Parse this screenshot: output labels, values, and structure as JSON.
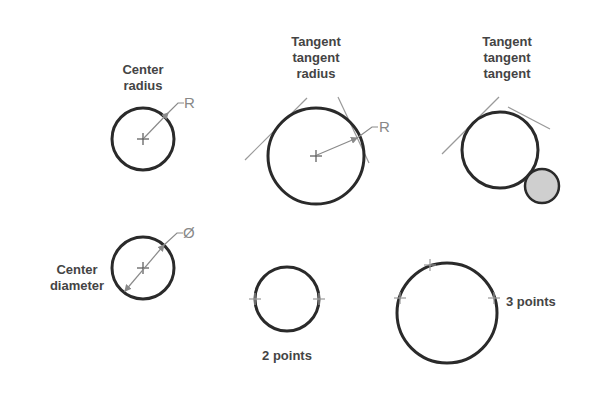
{
  "diagram": {
    "title": "",
    "colors": {
      "circle_stroke": "#2a2a2a",
      "construction_line": "#9a9a9a",
      "label_text": "#444444",
      "dimension_text": "#888888",
      "tangent_fill": "#cfcfcf",
      "background": "#ffffff"
    },
    "panels": [
      {
        "id": "center-radius",
        "label_line1": "Center",
        "label_line2": "radius",
        "dimension": "R"
      },
      {
        "id": "tangent-tangent-radius",
        "label_line1": "Tangent",
        "label_line2": "tangent",
        "label_line3": "radius",
        "dimension": "R"
      },
      {
        "id": "tangent-tangent-tangent",
        "label_line1": "Tangent",
        "label_line2": "tangent",
        "label_line3": "tangent"
      },
      {
        "id": "center-diameter",
        "label_line1": "Center",
        "label_line2": "diameter",
        "dimension": "Ø"
      },
      {
        "id": "two-points",
        "label_line1": "2 points"
      },
      {
        "id": "three-points",
        "label_line1": "3 points"
      }
    ]
  }
}
